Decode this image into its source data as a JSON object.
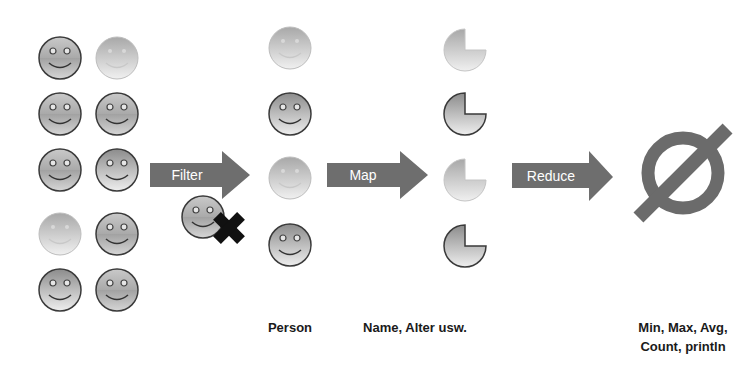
{
  "diagram": {
    "type": "stream-pipeline",
    "colors": {
      "arrow": "#6e6e6e",
      "arrow_text": "#ffffff",
      "null_symbol": "#6b6b6b",
      "x_mark": "#111111",
      "label_text": "#1a1a1a"
    },
    "source_grid": {
      "items": [
        {
          "style": "dark",
          "cx": 60,
          "cy": 58
        },
        {
          "style": "faded",
          "cx": 117,
          "cy": 58
        },
        {
          "style": "dark",
          "cx": 60,
          "cy": 114
        },
        {
          "style": "dark",
          "cx": 117,
          "cy": 114
        },
        {
          "style": "dark",
          "cx": 60,
          "cy": 170
        },
        {
          "style": "light",
          "cx": 117,
          "cy": 170
        },
        {
          "style": "faded",
          "cx": 60,
          "cy": 234
        },
        {
          "style": "dark",
          "cx": 117,
          "cy": 234
        },
        {
          "style": "light",
          "cx": 60,
          "cy": 290
        },
        {
          "style": "dark",
          "cx": 117,
          "cy": 290
        }
      ]
    },
    "steps": [
      {
        "label": "Filter"
      },
      {
        "label": "Map"
      },
      {
        "label": "Reduce"
      }
    ],
    "filtered_out": {
      "style": "dark",
      "cx": 205,
      "cy": 217,
      "mark": "x-mark"
    },
    "person_column": {
      "caption": "Person",
      "items": [
        {
          "style": "faded",
          "cy": 48
        },
        {
          "style": "light",
          "cy": 114
        },
        {
          "style": "faded",
          "cy": 178
        },
        {
          "style": "light",
          "cy": 245
        }
      ]
    },
    "mapped_column": {
      "caption": "Name, Alter usw.",
      "items": [
        {
          "style": "faded",
          "cy": 48
        },
        {
          "style": "outlined",
          "cy": 112
        },
        {
          "style": "faded",
          "cy": 178
        },
        {
          "style": "outlined",
          "cy": 245
        }
      ]
    },
    "result": {
      "symbol": "empty-set",
      "caption_line1": "Min, Max, Avg,",
      "caption_line2": "Count, println"
    }
  }
}
